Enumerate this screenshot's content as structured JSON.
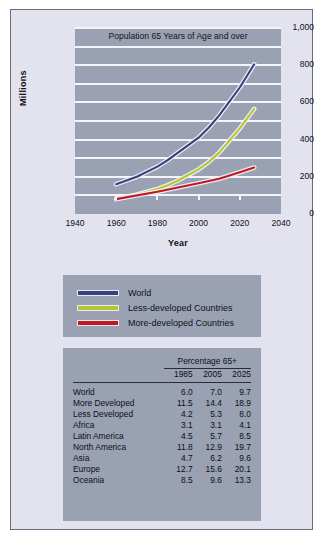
{
  "chart_data": {
    "type": "line",
    "title": "Population 65 Years of Age and over",
    "xlabel": "Year",
    "ylabel": "Millions",
    "xlim": [
      1940,
      2040
    ],
    "ylim": [
      0,
      1000
    ],
    "xticks": [
      "1940",
      "1960",
      "1980",
      "2000",
      "2020",
      "2040"
    ],
    "yticks": [
      "0",
      "200",
      "400",
      "600",
      "800",
      "1,000"
    ],
    "grid": "horizontal",
    "gridlines": [
      0,
      100,
      200,
      300,
      400,
      500,
      600,
      700,
      800,
      900,
      1000
    ],
    "legend_position": "below-plot",
    "series": [
      {
        "name": "World",
        "color": "#3b3f7c",
        "x": [
          1960,
          1970,
          1980,
          1985,
          1990,
          2000,
          2005,
          2010,
          2020,
          2027
        ],
        "values": [
          160,
          200,
          255,
          290,
          330,
          410,
          465,
          530,
          680,
          805
        ]
      },
      {
        "name": "Less-developed Countries",
        "color": "#b5c72e",
        "x": [
          1960,
          1970,
          1980,
          1985,
          1990,
          2000,
          2005,
          2010,
          2020,
          2027
        ],
        "values": [
          80,
          105,
          135,
          155,
          180,
          240,
          280,
          330,
          460,
          565
        ]
      },
      {
        "name": "More-developed Countries",
        "color": "#c01820",
        "x": [
          1960,
          1980,
          2000,
          2010,
          2020,
          2027
        ],
        "values": [
          80,
          120,
          165,
          190,
          225,
          250
        ]
      }
    ]
  },
  "legend": {
    "items": [
      {
        "label": "World",
        "color": "#3b3f7c"
      },
      {
        "label": "Less-developed Countries",
        "color": "#b5c72e"
      },
      {
        "label": "More-developed Countries",
        "color": "#c01820"
      }
    ]
  },
  "table": {
    "group_header": "Percentage 65+",
    "columns": [
      "1985",
      "2005",
      "2025"
    ],
    "rows": [
      {
        "name": "World",
        "values": [
          "6.0",
          "7.0",
          "9.7"
        ]
      },
      {
        "name": "More Developed",
        "values": [
          "11.5",
          "14.4",
          "18.9"
        ]
      },
      {
        "name": "Less Developed",
        "values": [
          "4.2",
          "5.3",
          "8.0"
        ]
      },
      {
        "name": "Africa",
        "values": [
          "3.1",
          "3.1",
          "4.1"
        ]
      },
      {
        "name": "Latin America",
        "values": [
          "4.5",
          "5.7",
          "8.5"
        ]
      },
      {
        "name": "North America",
        "values": [
          "11.8",
          "12.9",
          "19.7"
        ]
      },
      {
        "name": "Asia",
        "values": [
          "4.7",
          "6.2",
          "9.6"
        ]
      },
      {
        "name": "Europe",
        "values": [
          "12.7",
          "15.6",
          "20.1"
        ]
      },
      {
        "name": "Oceania",
        "values": [
          "8.5",
          "9.6",
          "13.3"
        ]
      }
    ]
  },
  "colors": {
    "figure_background": "#e3e3ef",
    "panel_background": "#9aa1b3",
    "gridline": "#f4f4fa",
    "border": "#6b6b7a"
  }
}
